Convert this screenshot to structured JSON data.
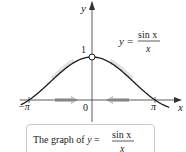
{
  "chart_data": {
    "type": "line",
    "title": "",
    "function": "sin(x)/x",
    "xlabel": "x",
    "ylabel": "y",
    "xlim": [
      -3.6,
      4.2
    ],
    "ylim": [
      -0.25,
      1.4
    ],
    "x_ticks": [
      {
        "value": -3.14159,
        "label": "−π"
      },
      {
        "value": 0,
        "label": "0"
      },
      {
        "value": 3.14159,
        "label": "π"
      }
    ],
    "y_ticks": [
      {
        "value": 1,
        "label": "1"
      }
    ],
    "open_point": {
      "x": 0,
      "y": 1
    },
    "annotation": {
      "prefix": "y =",
      "numerator": "sin x",
      "denominator": "x"
    },
    "approach_arrows": [
      "from-left",
      "from-right"
    ],
    "grid": false
  },
  "caption": {
    "prefix": "The graph of ",
    "var": "y",
    "eq": " = ",
    "numerator": "sin x",
    "denominator": "x"
  },
  "colors": {
    "curve": "#1a1a1a",
    "axis": "#333333",
    "arrow": "#bdbdbd",
    "box_border": "#c9c9c9"
  }
}
